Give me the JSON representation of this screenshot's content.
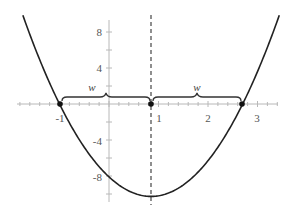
{
  "chart_data": {
    "type": "line",
    "title": "",
    "xlabel": "",
    "ylabel": "",
    "function": "y = 3(x + 1)(x - 2.7)",
    "series": [
      {
        "name": "parabola",
        "x": [
          -1.74,
          -1.5,
          -1.0,
          -0.5,
          0.0,
          0.5,
          0.85,
          1.0,
          1.5,
          2.0,
          2.5,
          2.7,
          3.0,
          3.44
        ],
        "y": [
          9.8,
          6.3,
          0.0,
          -4.8,
          -8.1,
          -9.9,
          -10.3,
          -10.2,
          -9.0,
          -6.3,
          -2.1,
          0.0,
          3.6,
          9.8
        ]
      }
    ],
    "roots": [
      -1,
      2.7
    ],
    "vertex": {
      "x": 0.85,
      "y": -10.3
    },
    "axis_of_symmetry": 0.85,
    "marked_points": [
      {
        "x": -1,
        "y": 0
      },
      {
        "x": 0.85,
        "y": 0
      },
      {
        "x": 2.7,
        "y": 0
      }
    ],
    "annotations": [
      {
        "type": "brace",
        "from": -1,
        "to": 0.85,
        "label": "w"
      },
      {
        "type": "brace",
        "from": 0.85,
        "to": 2.7,
        "label": "w"
      }
    ],
    "x_ticks": [
      -1,
      1,
      2,
      3
    ],
    "x_tick_labels": [
      "-1",
      "1",
      "2",
      "3"
    ],
    "y_ticks": [
      8,
      4,
      -4,
      -8
    ],
    "y_tick_labels": [
      "8",
      "4",
      "-4",
      "-8"
    ],
    "xlim": [
      -1.9,
      3.5
    ],
    "ylim": [
      -11,
      10
    ],
    "grid": false,
    "legend": null
  },
  "labels": {
    "x_ticks": [
      "-1",
      "1",
      "2",
      "3"
    ],
    "y_ticks": [
      "8",
      "4",
      "-4",
      "-8"
    ],
    "brace_left": "w",
    "brace_right": "w"
  },
  "colors": {
    "curve": "#222222",
    "axis": "#b8b8b8",
    "points": "#111111"
  }
}
